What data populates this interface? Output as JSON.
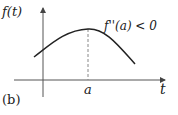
{
  "figure": {
    "panel_label": "(b)",
    "y_axis_label": "f(t)",
    "x_axis_label": "t",
    "point_label": "a",
    "annotation": "f''(a) < 0",
    "curve_description": "concave-down curve with maximum at t = a",
    "colors": {
      "curve": "#222222",
      "axes": "#555555",
      "dashed": "#888888"
    }
  }
}
